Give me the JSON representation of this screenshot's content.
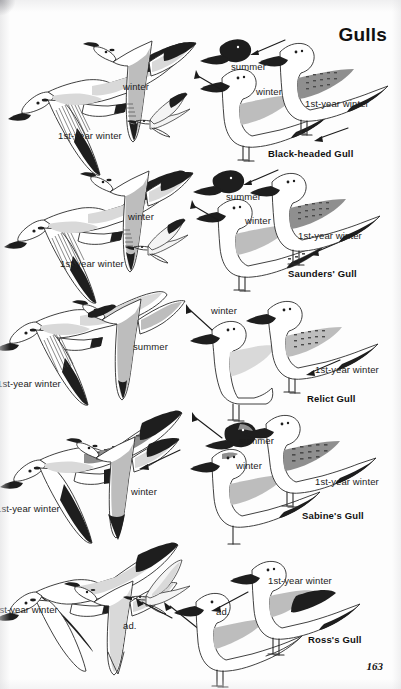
{
  "page": {
    "title": "Gulls",
    "number": "163",
    "width": 401,
    "height": 689,
    "background_color": "#fdfdfd",
    "ink_color": "#2b2b2b",
    "text_color": "#1b1b1b"
  },
  "plates": [
    {
      "species": "Black-headed Gull",
      "species_label_pos": {
        "x": 268,
        "y": 148
      },
      "flight_labels": [
        {
          "text": "winter",
          "x": 123,
          "y": 82
        },
        {
          "text": "1st-year winter",
          "x": 58,
          "y": 131
        }
      ],
      "perched_labels": [
        {
          "text": "summer",
          "x": 231,
          "y": 62
        },
        {
          "text": "winter",
          "x": 256,
          "y": 87
        },
        {
          "text": "1st-year winter",
          "x": 305,
          "y": 99
        }
      ]
    },
    {
      "species": "Saunders' Gull",
      "species_label_pos": {
        "x": 288,
        "y": 268
      },
      "flight_labels": [
        {
          "text": "winter",
          "x": 128,
          "y": 212
        },
        {
          "text": "1st-year winter",
          "x": 60,
          "y": 259
        }
      ],
      "perched_labels": [
        {
          "text": "summer",
          "x": 226,
          "y": 192
        },
        {
          "text": "winter",
          "x": 245,
          "y": 216
        },
        {
          "text": "1st-year winter",
          "x": 298,
          "y": 231
        }
      ]
    },
    {
      "species": "Relict Gull",
      "species_label_pos": {
        "x": 307,
        "y": 393
      },
      "flight_labels": [
        {
          "text": "summer",
          "x": 133,
          "y": 342
        },
        {
          "text": "1st-year winter",
          "x": -3,
          "y": 379
        }
      ],
      "perched_labels": [
        {
          "text": "winter",
          "x": 211,
          "y": 306
        },
        {
          "text": "1st-year winter",
          "x": 315,
          "y": 365
        }
      ]
    },
    {
      "species": "Sabine's Gull",
      "species_label_pos": {
        "x": 302,
        "y": 510
      },
      "flight_labels": [
        {
          "text": "winter",
          "x": 131,
          "y": 487
        },
        {
          "text": "1st-year winter",
          "x": -4,
          "y": 504
        }
      ],
      "perched_labels": [
        {
          "text": "summer",
          "x": 239,
          "y": 436
        },
        {
          "text": "winter",
          "x": 236,
          "y": 461
        },
        {
          "text": "1st-year winter",
          "x": 315,
          "y": 477
        }
      ]
    },
    {
      "species": "Ross's Gull",
      "species_label_pos": {
        "x": 308,
        "y": 634
      },
      "flight_labels": [
        {
          "text": "1st-year winter",
          "x": -6,
          "y": 605
        },
        {
          "text": "ad.",
          "x": 123,
          "y": 621
        }
      ],
      "perched_labels": [
        {
          "text": "ad.",
          "x": 216,
          "y": 607
        },
        {
          "text": "1st-year winter",
          "x": 268,
          "y": 576
        }
      ]
    }
  ],
  "legend_terms": {
    "summer": "summer",
    "winter": "winter",
    "first_year_winter": "1st-year winter",
    "adult": "ad."
  },
  "notes": {
    "layout": "Five species rows; flight illustrations on the left half, perched/standing illustrations on the right half, each row captioned with the species name in bold at lower right.",
    "leftmost_labels_cropped": "The '1st-year winter' captions in rows 3, 4 and 5 run off the left page edge."
  }
}
